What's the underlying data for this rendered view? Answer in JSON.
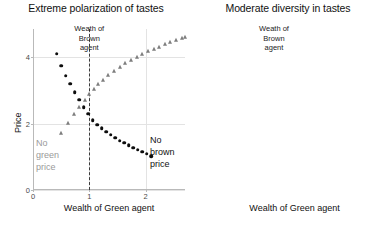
{
  "figure": {
    "panels": [
      {
        "key": "left",
        "title": "Extreme polarization of tastes",
        "xlabel": "Wealth of Green agent",
        "ylabel": "Price",
        "annotation": [
          "Weath of",
          "Brown",
          "agent"
        ],
        "note_left": [
          "No",
          "green",
          "price"
        ],
        "note_right": [
          "No",
          "brown",
          "price"
        ],
        "yticks": [
          "0",
          "2",
          "4"
        ],
        "xticks": [
          "0",
          "1",
          "2"
        ]
      },
      {
        "key": "right",
        "title": "Moderate diversity in tastes",
        "xlabel": "Wealth of Green agent",
        "ylabel": "",
        "annotation": [
          "Weath of",
          "Brown",
          "agent"
        ],
        "note_left": [],
        "note_right": [],
        "yticks": [
          "4",
          "6",
          "8",
          "10"
        ],
        "xticks": [
          "0",
          "1",
          "2"
        ]
      }
    ],
    "colors": {
      "brown_series": "#0d0d0d",
      "green_series": "#7d7d7d",
      "grid": "#e3e3e3",
      "axis": "#b9b9b9",
      "note_gray": "#9a9a9a",
      "text": "#111111"
    }
  },
  "chart_data": [
    {
      "type": "scatter",
      "title": "Extreme polarization of tastes",
      "xlabel": "Wealth of Green agent",
      "ylabel": "Price",
      "xlim": [
        0,
        2.7
      ],
      "ylim": [
        0,
        4.85
      ],
      "xticks": [
        0,
        1,
        2
      ],
      "yticks": [
        0,
        2,
        4
      ],
      "grid": true,
      "legend": "none",
      "annotations": [
        {
          "text": "Weath of Brown agent",
          "x": 1.0,
          "y": 4.6,
          "type": "vline-label"
        },
        {
          "text": "No green price",
          "x": 0.2,
          "y": 1.25,
          "type": "region-label",
          "color": "#9a9a9a"
        },
        {
          "text": "No brown price",
          "x": 2.25,
          "y": 1.3,
          "type": "region-label",
          "color": "#111111"
        }
      ],
      "vline": {
        "x": 1.0,
        "style": "dashed",
        "label": "Weath of Brown agent"
      },
      "series": [
        {
          "name": "brown-price",
          "marker": "circle",
          "color": "#0d0d0d",
          "x": [
            0.42,
            0.5,
            0.58,
            0.66,
            0.74,
            0.82,
            0.9,
            0.98,
            1.06,
            1.14,
            1.22,
            1.3,
            1.38,
            1.46,
            1.54,
            1.62,
            1.7,
            1.78,
            1.86,
            1.94,
            2.02,
            2.1
          ],
          "y": [
            4.1,
            3.75,
            3.45,
            3.2,
            2.95,
            2.72,
            2.5,
            2.3,
            2.1,
            1.97,
            1.86,
            1.76,
            1.66,
            1.57,
            1.49,
            1.42,
            1.35,
            1.28,
            1.22,
            1.16,
            1.1,
            1.02
          ]
        },
        {
          "name": "green-price",
          "marker": "triangle",
          "color": "#7d7d7d",
          "x": [
            0.5,
            0.62,
            0.72,
            0.82,
            0.92,
            1.0,
            1.08,
            1.16,
            1.24,
            1.34,
            1.44,
            1.54,
            1.64,
            1.74,
            1.84,
            1.94,
            2.04,
            2.14,
            2.24,
            2.34,
            2.44,
            2.54,
            2.64,
            2.7
          ],
          "y": [
            1.72,
            2.02,
            2.28,
            2.5,
            2.72,
            2.9,
            3.05,
            3.2,
            3.32,
            3.46,
            3.58,
            3.7,
            3.82,
            3.92,
            4.0,
            4.1,
            4.18,
            4.25,
            4.32,
            4.4,
            4.46,
            4.52,
            4.58,
            4.62
          ]
        }
      ]
    },
    {
      "type": "scatter",
      "title": "Moderate diversity in tastes",
      "xlabel": "Wealth of Green agent",
      "ylabel": "",
      "xlim": [
        0,
        2.72
      ],
      "ylim": [
        3.75,
        10.75
      ],
      "xticks": [
        0,
        1,
        2
      ],
      "yticks": [
        4,
        6,
        8,
        10
      ],
      "grid": true,
      "legend": "none",
      "annotations": [
        {
          "text": "Weath of Brown agent",
          "x": 1.0,
          "y": 10.6,
          "type": "vline-label"
        }
      ],
      "vline": {
        "x": 1.0,
        "style": "dashed",
        "label": "Weath of Brown agent"
      },
      "series": [
        {
          "name": "brown-price",
          "marker": "circle",
          "color": "#0d0d0d",
          "x": [
            0.1,
            0.18,
            0.26,
            0.34,
            0.42,
            0.5,
            0.58,
            0.66,
            0.74,
            0.82,
            0.9,
            0.98,
            1.06,
            1.14,
            1.22,
            1.3,
            1.38,
            1.46,
            1.54,
            1.62,
            1.7,
            1.78,
            1.86,
            1.94,
            2.02,
            2.1,
            2.18,
            2.26,
            2.34,
            2.42,
            2.5,
            2.58,
            2.66
          ],
          "y": [
            4.74,
            4.76,
            4.78,
            4.8,
            4.81,
            4.82,
            4.83,
            4.84,
            4.85,
            4.86,
            4.87,
            4.88,
            4.88,
            4.89,
            4.89,
            4.9,
            4.9,
            4.9,
            4.9,
            4.9,
            4.9,
            4.9,
            4.9,
            4.9,
            4.9,
            4.9,
            4.9,
            4.9,
            4.9,
            4.9,
            4.9,
            4.9,
            4.9
          ]
        },
        {
          "name": "green-price",
          "marker": "triangle",
          "color": "#7d7d7d",
          "x": [
            0.1,
            0.2,
            0.3,
            0.4,
            0.5,
            0.6,
            0.7,
            0.8,
            0.9,
            1.0,
            1.1,
            1.2,
            1.3,
            1.4,
            1.5,
            1.6,
            1.7,
            1.8,
            1.9,
            2.0,
            2.1,
            2.2,
            2.3,
            2.4,
            2.5,
            2.6,
            2.68
          ],
          "y": [
            5.42,
            5.98,
            6.5,
            6.95,
            7.35,
            7.7,
            8.0,
            8.28,
            8.48,
            8.62,
            8.88,
            9.08,
            9.25,
            9.4,
            9.55,
            9.68,
            9.78,
            9.88,
            9.95,
            10.02,
            10.08,
            10.14,
            10.18,
            10.22,
            10.26,
            10.3,
            10.32
          ]
        }
      ]
    }
  ]
}
